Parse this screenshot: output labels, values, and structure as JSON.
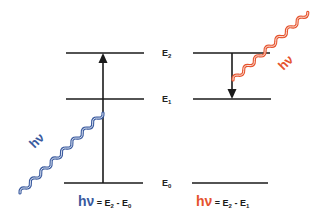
{
  "diagram": {
    "title": "",
    "colors": {
      "absorption": "#3a5a9e",
      "emission": "#e5532e",
      "lines": "#1a1a1a"
    },
    "levels": [
      {
        "name": "E2",
        "base": "E",
        "sub": "2"
      },
      {
        "name": "E1",
        "base": "E",
        "sub": "1"
      },
      {
        "name": "E0",
        "base": "E",
        "sub": "0"
      }
    ],
    "absorption": {
      "photon_label": "hν",
      "formula": {
        "hv": "hν",
        "eq": " = E",
        "sub1": "2",
        "minus": " - E",
        "sub2": "0"
      }
    },
    "emission": {
      "photon_label": "hν",
      "formula": {
        "hv": "hν",
        "eq": " = E",
        "sub1": "2",
        "minus": " - E",
        "sub2": "1"
      }
    }
  }
}
